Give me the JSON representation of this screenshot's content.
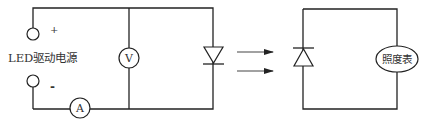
{
  "diagram": {
    "left_circuit": {
      "source_label": "LED驱动电源",
      "plus_terminal": "+",
      "minus_terminal": "-",
      "voltmeter_label": "V",
      "ammeter_label": "A",
      "component": "LED (diode)"
    },
    "light_arrows": 2,
    "right_circuit": {
      "component": "photodiode (diode)",
      "meter_label": "照度表"
    },
    "colors": {
      "line": "#222222",
      "background": "#ffffff"
    }
  }
}
